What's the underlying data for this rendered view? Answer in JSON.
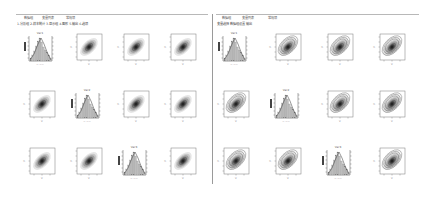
{
  "window": {
    "left_panel": {
      "tabs": [
        {
          "label": "数据组"
        },
        {
          "label": "变量列表"
        },
        {
          "label": "常规项"
        }
      ],
      "subheader": "1.分析组  2.样本统计  3.显示组  4.图形  5.输出  6.选项"
    },
    "right_panel": {
      "tabs": [
        {
          "label": "数据组"
        },
        {
          "label": "变量列表"
        },
        {
          "label": "常规项"
        }
      ],
      "subheader": "变量选择  数据组设置  输出"
    }
  },
  "chart_data": [
    {
      "type": "scatter_matrix",
      "title": "Left panel pairs plot",
      "layout": {
        "rows": 3,
        "cols": 4
      },
      "diagonal": "histogram",
      "cells": [
        {
          "row": 0,
          "col": 0,
          "kind": "histogram",
          "label": "Var1"
        },
        {
          "row": 0,
          "col": 1,
          "kind": "density"
        },
        {
          "row": 0,
          "col": 2,
          "kind": "density"
        },
        {
          "row": 0,
          "col": 3,
          "kind": "density"
        },
        {
          "row": 1,
          "col": 0,
          "kind": "density"
        },
        {
          "row": 1,
          "col": 1,
          "kind": "histogram",
          "label": "Var2"
        },
        {
          "row": 1,
          "col": 2,
          "kind": "density"
        },
        {
          "row": 1,
          "col": 3,
          "kind": "density"
        },
        {
          "row": 2,
          "col": 0,
          "kind": "density"
        },
        {
          "row": 2,
          "col": 1,
          "kind": "density"
        },
        {
          "row": 2,
          "col": 2,
          "kind": "histogram",
          "label": "Var3"
        },
        {
          "row": 2,
          "col": 3,
          "kind": "density"
        }
      ],
      "correlation": "positive"
    },
    {
      "type": "scatter_matrix",
      "title": "Right panel pairs plot",
      "layout": {
        "rows": 3,
        "cols": 4
      },
      "diagonal": "histogram",
      "cells": [
        {
          "row": 0,
          "col": 0,
          "kind": "histogram",
          "label": "Var1"
        },
        {
          "row": 0,
          "col": 1,
          "kind": "contour"
        },
        {
          "row": 0,
          "col": 2,
          "kind": "contour"
        },
        {
          "row": 0,
          "col": 3,
          "kind": "contour"
        },
        {
          "row": 1,
          "col": 0,
          "kind": "contour"
        },
        {
          "row": 1,
          "col": 1,
          "kind": "histogram",
          "label": "Var2"
        },
        {
          "row": 1,
          "col": 2,
          "kind": "contour"
        },
        {
          "row": 1,
          "col": 3,
          "kind": "contour"
        },
        {
          "row": 2,
          "col": 0,
          "kind": "contour"
        },
        {
          "row": 2,
          "col": 1,
          "kind": "contour"
        },
        {
          "row": 2,
          "col": 2,
          "kind": "histogram",
          "label": "Var3"
        },
        {
          "row": 2,
          "col": 3,
          "kind": "contour"
        }
      ],
      "correlation": "positive"
    }
  ],
  "colors": {
    "divider": "#9a9a9a",
    "ink": "#333333"
  }
}
